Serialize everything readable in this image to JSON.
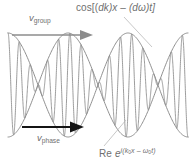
{
  "figure": {
    "background_color": "#ffffff",
    "wave_color": "#8a8a8a",
    "envelope_color": "#8a8a8a",
    "label_color": "#6f6f6f",
    "arrow_group_color": "#8c8c8c",
    "arrow_phase_color": "#111111",
    "leader_color": "#b3b3b3"
  },
  "labels": {
    "v_group": {
      "symbol": "v",
      "subscript": "group"
    },
    "v_phase": {
      "symbol": "v",
      "subscript": "phase"
    },
    "envelope_formula": {
      "prefix": "cos[(",
      "dk": "dk",
      "mid": ")x – (",
      "domega": "dω",
      "suffix": ")t]",
      "plain": "cos[(dk)x – (dω)t]"
    },
    "carrier_formula": {
      "re": "Re",
      "e": "e",
      "exponent_i": "i(",
      "k0": "k",
      "k0_sub": "0",
      "x": "x – ",
      "w0": "ω",
      "w0_sub": "0",
      "t": "t)",
      "plain": "Re e^{i(k₀x – ω₀t)}"
    }
  },
  "chart_data": {
    "type": "line",
    "xlabel": "x",
    "ylabel": "amplitude",
    "grid": false,
    "legend": "none",
    "xlim": [
      0,
      193
    ],
    "ylim": [
      -1,
      1
    ],
    "baseline_y": 85,
    "amplitude_px": 52,
    "plot_left": 8,
    "plot_right": 188,
    "series": [
      {
        "name": "envelope-upper",
        "role": "envelope",
        "expression": "cos[(dk)x - (dw)t]",
        "cycles": 1.5,
        "phase_deg": 0
      },
      {
        "name": "envelope-lower",
        "role": "envelope",
        "expression": "-cos[(dk)x - (dw)t]",
        "cycles": 1.5,
        "phase_deg": 180
      },
      {
        "name": "carrier",
        "role": "carrier",
        "expression": "Re e^{i(k0 x - w0 t)}",
        "cycles": 16,
        "phase_deg": 0
      }
    ],
    "envelope_nodes_x": [
      65,
      127
    ],
    "annotations": [
      {
        "text": "v_group",
        "x": 44,
        "y": 18,
        "arrow": "right",
        "arrow_from_x": 12,
        "arrow_to_x": 88,
        "arrow_y": 35
      },
      {
        "text": "v_phase",
        "x": 52,
        "y": 138,
        "arrow": "right",
        "arrow_from_x": 20,
        "arrow_to_x": 80,
        "arrow_y": 128
      },
      {
        "text": "cos[(dk)x - (dw)t]",
        "x": 76,
        "y": 8,
        "leader_to_x": 152,
        "leader_to_y": 46
      },
      {
        "text": "Re e^{i(k0x - w0t)}",
        "x": 99,
        "y": 152,
        "leader_to_x": 118,
        "leader_to_y": 122
      }
    ]
  }
}
